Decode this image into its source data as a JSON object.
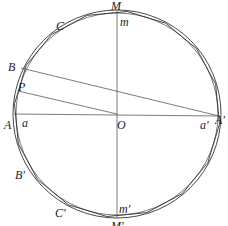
{
  "diagram": {
    "type": "geometry",
    "colors": {
      "stroke": "#333333",
      "background": "#ffffff",
      "label": "#222222"
    },
    "center": {
      "x": 117,
      "y": 114
    },
    "outer_radius": 104,
    "inner_radius": 101,
    "polygon_sides": 16,
    "polygon_radius": 103,
    "lines": [
      {
        "name": "diameter-horizontal",
        "from": "A",
        "to": "A'",
        "x1": 14,
        "y1": 114,
        "x2": 220,
        "y2": 116
      },
      {
        "name": "diameter-vertical",
        "from": "M",
        "to": "M'",
        "x1": 117,
        "y1": 11,
        "x2": 117,
        "y2": 218
      },
      {
        "name": "chord-B-Aprime",
        "from": "B",
        "to": "A'",
        "x1": 21,
        "y1": 68,
        "x2": 219,
        "y2": 116
      },
      {
        "name": "segment-P-O",
        "from": "P",
        "to": "O",
        "x1": 18,
        "y1": 91,
        "x2": 117,
        "y2": 114
      }
    ],
    "labels": {
      "M": "M",
      "m": "m",
      "C": "C",
      "B": "B",
      "P": "P",
      "A": "A",
      "a": "a",
      "O": "O",
      "a_prime": "a'",
      "A_prime": "A'",
      "B_prime": "B'",
      "C_prime": "C'",
      "m_prime": "m'",
      "M_prime": "M'"
    }
  }
}
